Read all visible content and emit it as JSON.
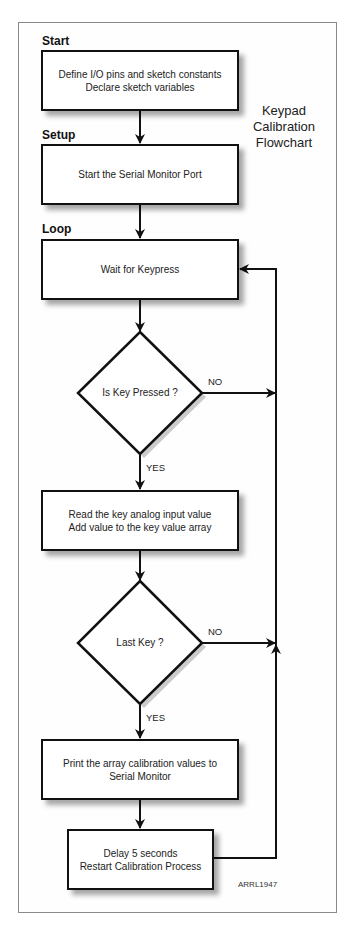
{
  "diagram": {
    "title_lines": [
      "Keypad",
      "Calibration",
      "Flowchart"
    ],
    "sections": {
      "start": "Start",
      "setup": "Setup",
      "loop": "Loop"
    },
    "nodes": {
      "init": {
        "lines": [
          "Define I/O pins and sketch constants",
          "Declare sketch variables"
        ]
      },
      "serial": {
        "lines": [
          "Start the Serial Monitor Port"
        ]
      },
      "wait": {
        "lines": [
          "Wait for Keypress"
        ]
      },
      "key_pressed": {
        "text": "Is Key Pressed ?"
      },
      "read": {
        "lines": [
          "Read the key analog input value",
          "Add value to the key value array"
        ]
      },
      "last_key": {
        "text": "Last Key ?"
      },
      "print": {
        "lines": [
          "Print the array calibration values to",
          "Serial Monitor"
        ]
      },
      "delay": {
        "lines": [
          "Delay 5 seconds",
          "Restart Calibration Process"
        ]
      }
    },
    "edge_labels": {
      "key_pressed_no": "NO",
      "key_pressed_yes": "YES",
      "last_key_no": "NO",
      "last_key_yes": "YES"
    },
    "credit": "ARRL1947"
  }
}
